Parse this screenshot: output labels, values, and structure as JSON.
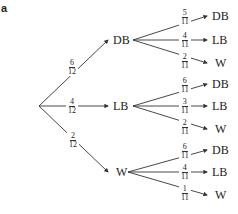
{
  "part_label": "a",
  "tree": {
    "root": {
      "x": 39,
      "y": 106
    },
    "first_level": [
      {
        "label": "DB",
        "prob_num": "6",
        "prob_den": "12",
        "x": 113,
        "y": 40,
        "children": [
          {
            "label": "DB",
            "prob_num": "5",
            "prob_den": "11",
            "y": 16
          },
          {
            "label": "LB",
            "prob_num": "4",
            "prob_den": "11",
            "y": 40
          },
          {
            "label": "W",
            "prob_num": "2",
            "prob_den": "11",
            "y": 63
          }
        ]
      },
      {
        "label": "LB",
        "prob_num": "4",
        "prob_den": "12",
        "x": 113,
        "y": 106,
        "children": [
          {
            "label": "DB",
            "prob_num": "6",
            "prob_den": "11",
            "y": 84
          },
          {
            "label": "LB",
            "prob_num": "3",
            "prob_den": "11",
            "y": 106
          },
          {
            "label": "W",
            "prob_num": "2",
            "prob_den": "11",
            "y": 129
          }
        ]
      },
      {
        "label": "W",
        "prob_num": "2",
        "prob_den": "12",
        "x": 113,
        "y": 172,
        "children": [
          {
            "label": "DB",
            "prob_num": "6",
            "prob_den": "11",
            "y": 150
          },
          {
            "label": "LB",
            "prob_num": "4",
            "prob_den": "11",
            "y": 172
          },
          {
            "label": "W",
            "prob_num": "1",
            "prob_den": "11",
            "y": 195
          }
        ]
      }
    ]
  },
  "colors": {
    "line": "#333333",
    "text": "#222222",
    "background": "#ffffff"
  }
}
